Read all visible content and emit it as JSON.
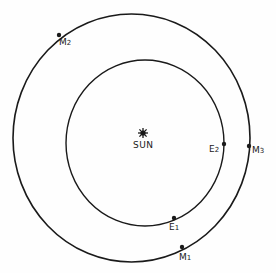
{
  "diagram": {
    "center_label": "SUN",
    "sun_icon": "sun-icon",
    "orbits": [
      {
        "name": "earth-orbit",
        "cx": 145,
        "cy": 143,
        "rx": 79,
        "ry": 83
      },
      {
        "name": "mars-orbit",
        "cx": 131.5,
        "cy": 138,
        "rx": 118.5,
        "ry": 124
      }
    ],
    "points": [
      {
        "id": "E1",
        "letter": "E",
        "num": "1",
        "x": 174,
        "y": 218
      },
      {
        "id": "E2",
        "letter": "E",
        "num": "2",
        "x": 224,
        "y": 144
      },
      {
        "id": "M1",
        "letter": "M",
        "num": "1",
        "x": 182,
        "y": 247
      },
      {
        "id": "M2",
        "letter": "M",
        "num": "2",
        "x": 59,
        "y": 35
      },
      {
        "id": "M3",
        "letter": "M",
        "num": "3",
        "x": 249,
        "y": 146
      }
    ],
    "line_color": "#1a1a1a"
  }
}
